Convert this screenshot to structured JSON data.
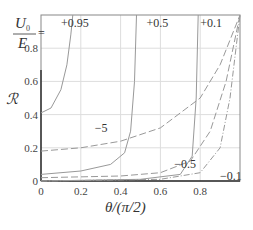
{
  "chart_data": {
    "type": "line",
    "title": "",
    "xlabel": "θ/(π/2)",
    "ylabel": "ℛ",
    "xlim": [
      0,
      1
    ],
    "ylim": [
      0,
      1
    ],
    "grid": true,
    "x_ticks": [
      "0",
      "0.2",
      "0.4",
      "0.6",
      "0.8"
    ],
    "y_ticks": [
      "0",
      "0.2",
      "0.4",
      "0.6",
      "0.8"
    ],
    "legend_title": "U0/E =",
    "series": [
      {
        "name": "+0.95",
        "style": "solid",
        "x": [
          0,
          0.05,
          0.1,
          0.13,
          0.15,
          0.16
        ],
        "y": [
          0.41,
          0.44,
          0.55,
          0.7,
          0.88,
          1.0
        ]
      },
      {
        "name": "+0.5",
        "style": "solid",
        "x": [
          0,
          0.2,
          0.35,
          0.42,
          0.45,
          0.47,
          0.48
        ],
        "y": [
          0.04,
          0.06,
          0.1,
          0.17,
          0.3,
          0.6,
          1.0
        ]
      },
      {
        "name": "+0.1",
        "style": "solid",
        "x": [
          0,
          0.5,
          0.7,
          0.76,
          0.78,
          0.79
        ],
        "y": [
          0.0,
          0.01,
          0.04,
          0.15,
          0.5,
          1.0
        ]
      },
      {
        "name": "-5",
        "style": "dashed",
        "x": [
          0,
          0.2,
          0.4,
          0.6,
          0.8,
          0.9,
          1.0
        ],
        "y": [
          0.18,
          0.2,
          0.24,
          0.32,
          0.5,
          0.7,
          1.0
        ]
      },
      {
        "name": "-0.5",
        "style": "dashed",
        "x": [
          0,
          0.4,
          0.6,
          0.75,
          0.85,
          0.93,
          1.0
        ],
        "y": [
          0.02,
          0.03,
          0.05,
          0.12,
          0.3,
          0.6,
          1.0
        ]
      },
      {
        "name": "-0.1",
        "style": "dash-dot",
        "x": [
          0,
          0.6,
          0.8,
          0.9,
          0.95,
          1.0
        ],
        "y": [
          0.0,
          0.01,
          0.05,
          0.2,
          0.5,
          1.0
        ]
      }
    ],
    "curve_labels": [
      {
        "text": "+0.95",
        "x": 0.1,
        "y": 0.95
      },
      {
        "text": "+0.5",
        "x": 0.53,
        "y": 0.95
      },
      {
        "text": "+0.1",
        "x": 0.8,
        "y": 0.95
      },
      {
        "text": "−5",
        "x": 0.27,
        "y": 0.32
      },
      {
        "text": "−0.5",
        "x": 0.67,
        "y": 0.1
      },
      {
        "text": "−0.1",
        "x": 0.9,
        "y": 0.03
      }
    ]
  }
}
